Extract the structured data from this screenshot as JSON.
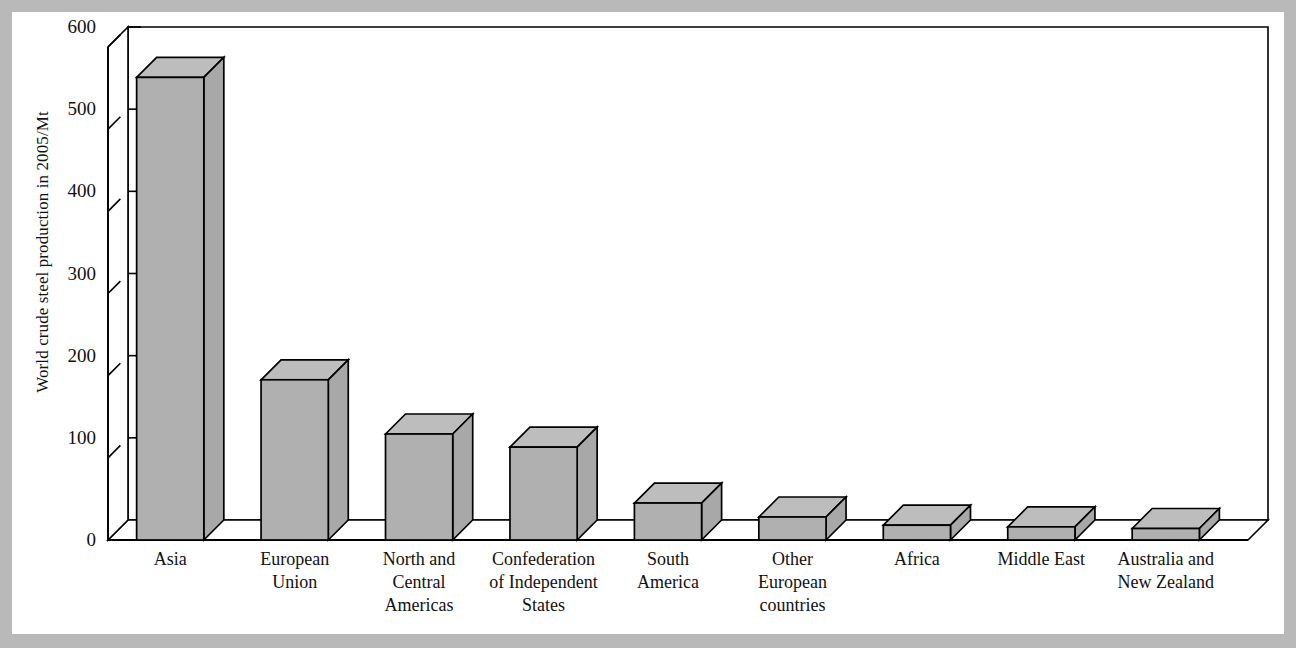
{
  "figure": {
    "background_color": "#b9b9b9",
    "sheet_color": "#ffffff",
    "bar_fill_color": "#b0b0b0",
    "bar_top_color": "#bdbdbd",
    "bar_side_color": "#a8a8a8",
    "line_color": "#000000"
  },
  "chart_data": {
    "type": "bar",
    "title": "",
    "subtitle": "",
    "xlabel": "",
    "ylabel": "World crude steel production in 2005/Mt",
    "ylim": [
      0,
      600
    ],
    "ytick_values": [
      0,
      100,
      200,
      300,
      400,
      500,
      600
    ],
    "ytick_labels": [
      "0",
      "100",
      "200",
      "300",
      "400",
      "500",
      "600"
    ],
    "grid": false,
    "legend": false,
    "legend_position": "none",
    "three_d": true,
    "categories": [
      "Asia",
      "European Union",
      "North and Central Americas",
      "Confederation of Independent States",
      "South America",
      "Other European countries",
      "Africa",
      "Middle East",
      "Australia and New Zealand"
    ],
    "category_label_lines": [
      [
        "Asia"
      ],
      [
        "European",
        "Union"
      ],
      [
        "North and",
        "Central",
        "Americas"
      ],
      [
        "Confederation",
        "of Independent",
        "States"
      ],
      [
        "South",
        "America"
      ],
      [
        "Other",
        "European",
        "countries"
      ],
      [
        "Africa"
      ],
      [
        "Middle East"
      ],
      [
        "Australia and",
        "New Zealand"
      ]
    ],
    "values": [
      563,
      195,
      129,
      113,
      45,
      28,
      18,
      16,
      14
    ],
    "units": "Mt",
    "annotations": []
  }
}
